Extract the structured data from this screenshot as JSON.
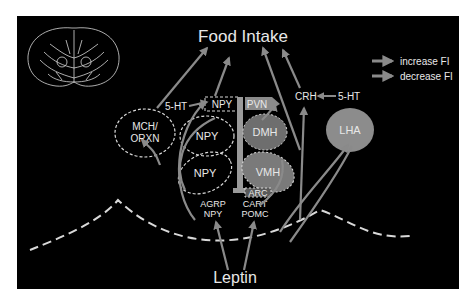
{
  "title": "Food Intake",
  "bottom_label": "Leptin",
  "legend": {
    "items": [
      {
        "label": "increase FI",
        "color": "#8a8a8a"
      },
      {
        "label": "decrease FI",
        "color": "#8a8a8a"
      }
    ]
  },
  "nuclei": {
    "mch": {
      "line1": "MCH/",
      "line2": "ORXN"
    },
    "npy_top": "NPY",
    "npy_mid": "NPY",
    "npy_low": "NPY",
    "pvn": "PVN",
    "dmh": "DMH",
    "vmh": "VMH",
    "arc": "ARC",
    "lha": "LHA",
    "crh": "CRH"
  },
  "neurotransmitters": {
    "ht_left": "5-HT",
    "ht_right": "5-HT"
  },
  "arc_outputs": {
    "left": {
      "line1": "AGRP",
      "line2": "NPY"
    },
    "right": {
      "line1": "CART",
      "line2": "POMC"
    }
  },
  "colors": {
    "background": "#000000",
    "arrow": "#8a8a8a",
    "text": "#e8e8e8",
    "dashed_outline": "#d8d8d8",
    "nucleus_fill": "#6e6e6e",
    "lha_fill": "#8c8c8c"
  }
}
